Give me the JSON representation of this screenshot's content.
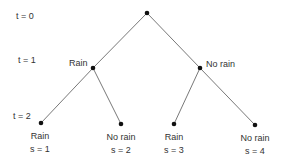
{
  "time_labels": {
    "t0": "t = 0",
    "t1": "t = 1",
    "t2": "t = 2"
  },
  "branches": {
    "left": "Rain",
    "right": "No rain"
  },
  "leaves": [
    {
      "label": "Rain",
      "state": "s = 1"
    },
    {
      "label": "No rain",
      "state": "s = 2"
    },
    {
      "label": "Rain",
      "state": "s = 3"
    },
    {
      "label": "No rain",
      "state": "s = 4"
    }
  ],
  "colors": {
    "line": "#555555",
    "node": "#111111",
    "text": "#333333"
  }
}
